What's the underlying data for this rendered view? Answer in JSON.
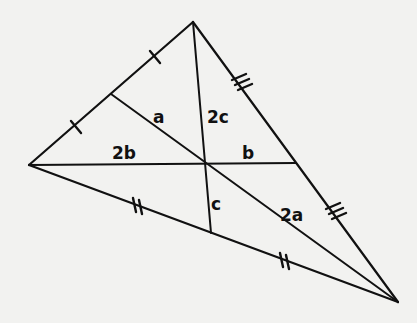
{
  "diagram": {
    "type": "triangle-medians",
    "background": "#f2f2f0",
    "stroke_color": "#111111",
    "vertices": {
      "top": [
        193,
        22
      ],
      "left": [
        29,
        165
      ],
      "right": [
        398,
        302
      ]
    },
    "centroid": [
      206,
      164
    ],
    "midpoints": {
      "top_left_side": [
        111,
        94
      ],
      "top_right_side": [
        296,
        163
      ],
      "left_right_side": [
        211,
        233
      ]
    },
    "tick_marks": {
      "top_left_side": "single",
      "left_right_side": "double",
      "top_right_side": "triple"
    },
    "segment_labels": [
      {
        "text": "a",
        "segment": "median from top-left midpoint to centroid",
        "x": 153,
        "y": 123
      },
      {
        "text": "2a",
        "segment": "centroid to right vertex",
        "x": 280,
        "y": 221
      },
      {
        "text": "2b",
        "segment": "left vertex to centroid",
        "x": 112,
        "y": 159
      },
      {
        "text": "b",
        "segment": "centroid to right-side midpoint",
        "x": 242,
        "y": 159
      },
      {
        "text": "2c",
        "segment": "top vertex to centroid",
        "x": 207,
        "y": 123
      },
      {
        "text": "c",
        "segment": "centroid to bottom-side midpoint",
        "x": 211,
        "y": 210
      }
    ]
  }
}
